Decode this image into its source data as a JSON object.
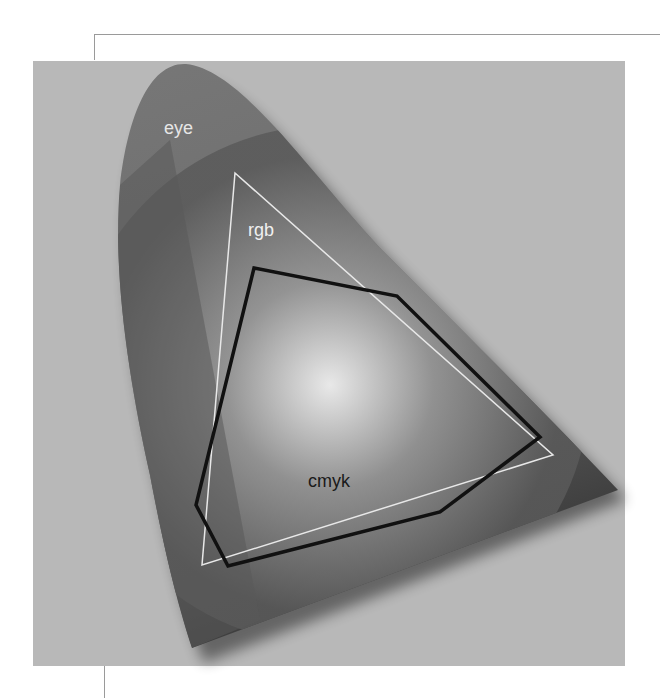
{
  "diagram": {
    "labels": {
      "eye": "eye",
      "rgb": "rgb",
      "cmyk": "cmyk"
    },
    "colors": {
      "panel_background": "#b8b8b8",
      "eye_gamut_fill": "#6e6e6e",
      "rgb_outline": "#e8e8e8",
      "cmyk_outline": "#111111",
      "eye_label": "#e6e6e6",
      "rgb_label": "#f0f0f0",
      "cmyk_label": "#1a1a1a"
    },
    "shapes": {
      "rgb_triangle": [
        [
          235,
          173
        ],
        [
          553,
          455
        ],
        [
          202,
          565
        ]
      ],
      "cmyk_polygon": [
        [
          254,
          268
        ],
        [
          397,
          296
        ],
        [
          540,
          437
        ],
        [
          440,
          512
        ],
        [
          228,
          566
        ],
        [
          196,
          505
        ]
      ]
    }
  }
}
